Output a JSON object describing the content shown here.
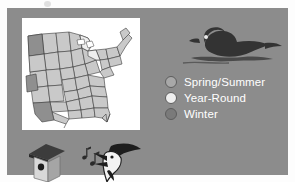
{
  "panel": {
    "background_color": "#8c8c8c"
  },
  "map": {
    "name": "united-states-range-map",
    "background_color": "#ffffff",
    "state_fill": "#c9c9c9",
    "state_outline": "#3a3a3a",
    "winter_fill": "#8f8f8f",
    "year_round_fill": "#efefef"
  },
  "bird_illustration": {
    "name": "wood-duck-silhouette",
    "color": "#333333",
    "water_color": "#4a4a4a"
  },
  "legend": {
    "items": [
      {
        "label": "Spring/Summer",
        "color": "#a8a8a8",
        "icon": "circle-swatch"
      },
      {
        "label": "Year-Round",
        "color": "#eeeeee",
        "icon": "circle-swatch"
      },
      {
        "label": "Winter",
        "color": "#7a7a7a",
        "icon": "circle-swatch"
      }
    ],
    "text_color": "#ffffff"
  },
  "icons": {
    "birdhouse": {
      "name": "birdhouse-icon",
      "roof_color": "#3c3c3c",
      "body_color": "#d8d8d8",
      "side_color": "#a5a5a5",
      "hole_color": "#1d1d1d"
    },
    "songbird": {
      "name": "singing-bird-head-icon",
      "color": "#1d1d1d",
      "highlight_color": "#f2f2f2",
      "notes_color": "#2a2a2a"
    }
  }
}
